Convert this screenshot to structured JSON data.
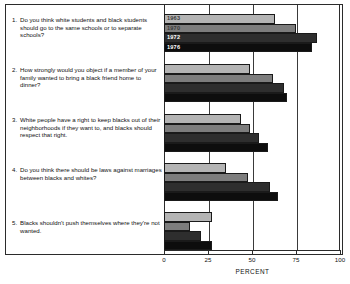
{
  "chart_data": {
    "type": "bar",
    "orientation": "horizontal",
    "title": "",
    "xlabel": "PERCENT",
    "ylabel": "",
    "xlim": [
      0,
      100
    ],
    "xticks": [
      "0",
      "25",
      "50",
      "75",
      "100"
    ],
    "grid": true,
    "legend_position": "inside-first-group",
    "categories": [
      "1. Do you think white students and black students should go to the same schools or to separate schools?",
      "2. How strongly would you object if a member of your family wanted to bring a black friend home to dinner?",
      "3. White people have a right to keep blacks out of their neighborhoods if they want to, and blacks should respect that right.",
      "4. Do you think there should be laws against marriages between blacks and whites?",
      "5. Blacks shouldn't push themselves where they're not wanted."
    ],
    "series": [
      {
        "name": "1963",
        "color": "#b4b4b4",
        "values": [
          63,
          49,
          44,
          35,
          27
        ]
      },
      {
        "name": "1970",
        "color": "#7d7d7d",
        "values": [
          75,
          62,
          49,
          48,
          15
        ]
      },
      {
        "name": "1972",
        "color": "#2e2e2e",
        "values": [
          87,
          68,
          54,
          60,
          21
        ]
      },
      {
        "name": "1976",
        "color": "#0d0d0d",
        "values": [
          84,
          70,
          59,
          65,
          27
        ]
      }
    ]
  },
  "questions": [
    {
      "number": "1.",
      "lines": "Do you think white students and black students should go to the same schools or to separate schools?"
    },
    {
      "number": "2.",
      "lines": "How strongly would you object if a member of your family wanted to bring a black friend home to dinner?"
    },
    {
      "number": "3.",
      "lines": "White people have a right to keep blacks out of their neighborhoods if they want to, and blacks should respect that right."
    },
    {
      "number": "4.",
      "lines": "Do you think there should be laws against marriages between blacks and whites?"
    },
    {
      "number": "5.",
      "lines": "Blacks shouldn't push themselves where they're not wanted."
    }
  ],
  "legend": {
    "items": [
      "1963",
      "1970",
      "1972",
      "1976"
    ]
  },
  "axis": {
    "ticks": [
      "0",
      "25",
      "50",
      "75",
      "100"
    ],
    "title": "PERCENT"
  }
}
